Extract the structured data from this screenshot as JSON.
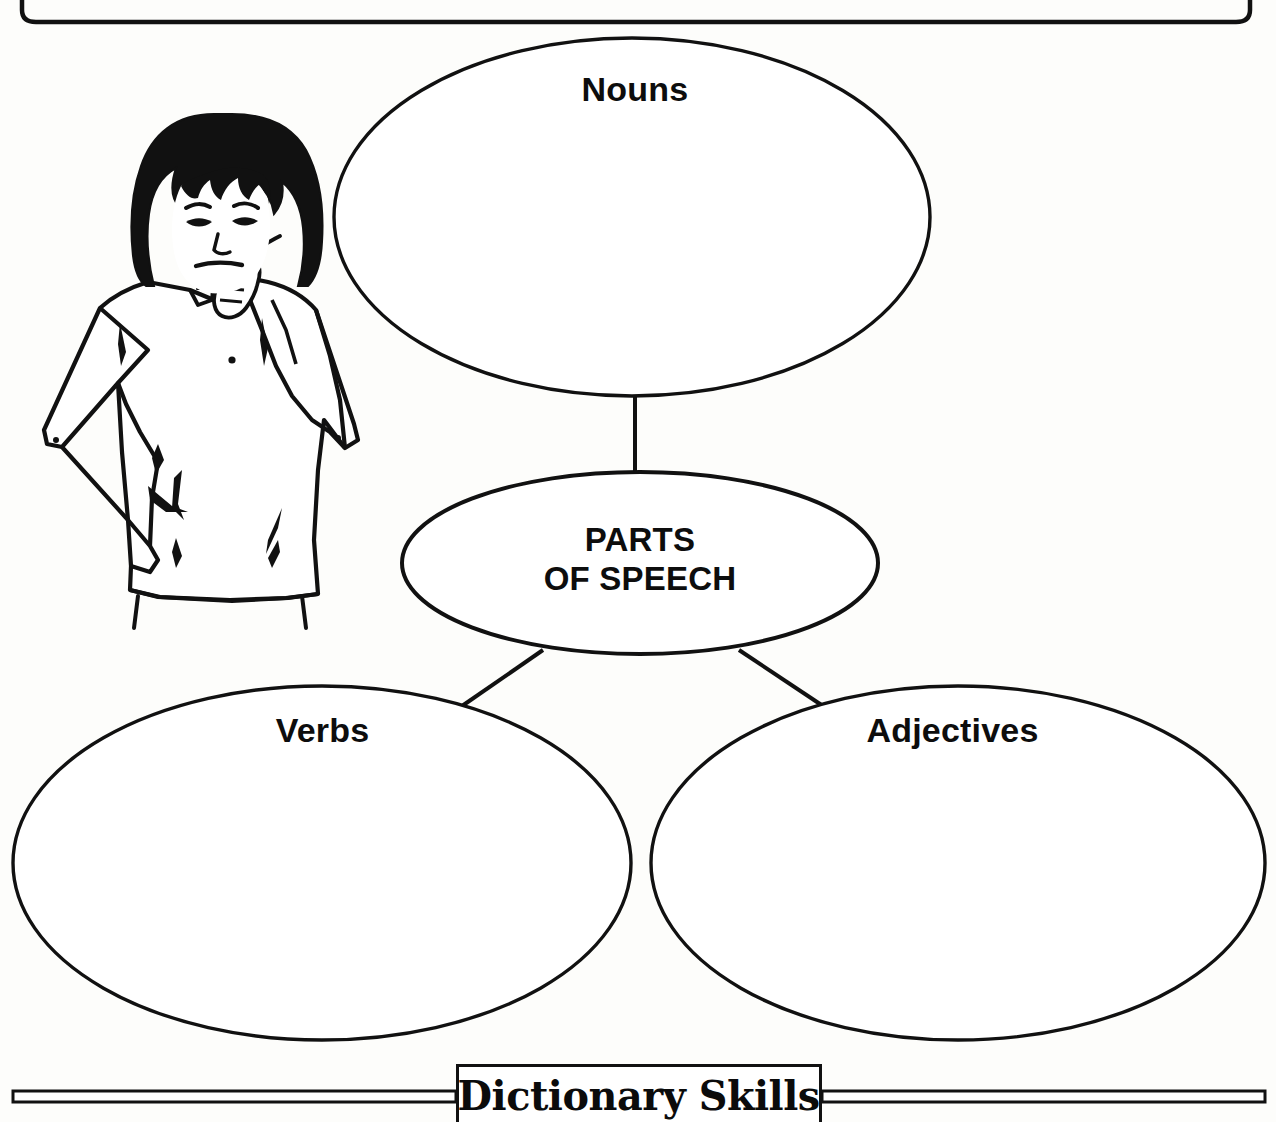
{
  "page": {
    "width": 1276,
    "height": 1122,
    "background_color": "#fdfdfb",
    "ink_color": "#111111"
  },
  "worksheet": {
    "type": "graphic-organizer",
    "border": {
      "name": "rounded-page-border",
      "visible_portion": "bottom-edge-with-rounded-corners"
    },
    "illustration": {
      "name": "thinking-girl-illustration",
      "description": "Line drawing of a girl with a black bob haircut, one hand resting on her chin in a thinking pose and the other hand on her hip",
      "hair_color": "#111111"
    },
    "diagram": {
      "center": {
        "id": "center",
        "label": "PARTS\nOF SPEECH",
        "label_line_1": "PARTS",
        "label_line_2": "OF SPEECH"
      },
      "branches": [
        {
          "id": "nouns",
          "label": "Nouns",
          "position": "top"
        },
        {
          "id": "verbs",
          "label": "Verbs",
          "position": "bottom-left"
        },
        {
          "id": "adjectives",
          "label": "Adjectives",
          "position": "bottom-right"
        }
      ],
      "connectors": [
        {
          "from": "center",
          "to": "nouns",
          "style": "vertical-line"
        },
        {
          "from": "center",
          "to": "verbs",
          "style": "diagonal-line"
        },
        {
          "from": "center",
          "to": "adjectives",
          "style": "diagonal-line"
        }
      ]
    },
    "footer": {
      "title": "Dictionary Skills",
      "rule_style": "double-horizontal-rule"
    }
  }
}
